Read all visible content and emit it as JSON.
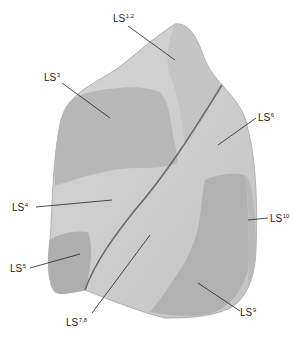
{
  "diagram": {
    "labels": [
      {
        "id": "ls12",
        "base": "LS",
        "sup": "1,2",
        "x": 113,
        "y": 13
      },
      {
        "id": "ls3",
        "base": "LS",
        "sup": "3",
        "x": 44,
        "y": 72
      },
      {
        "id": "ls6",
        "base": "LS",
        "sup": "6",
        "x": 258,
        "y": 112
      },
      {
        "id": "ls4",
        "base": "LS",
        "sup": "4",
        "x": 12,
        "y": 202
      },
      {
        "id": "ls10",
        "base": "LS",
        "sup": "10",
        "x": 270,
        "y": 213
      },
      {
        "id": "ls5",
        "base": "LS",
        "sup": "5",
        "x": 10,
        "y": 263
      },
      {
        "id": "ls78",
        "base": "LS",
        "sup": "7,8",
        "x": 66,
        "y": 317
      },
      {
        "id": "ls9",
        "base": "LS",
        "sup": "9",
        "x": 240,
        "y": 307
      }
    ],
    "colors": {
      "light": "#dcdcdc",
      "mid": "#bdbdbd",
      "dark": "#a4a4a4",
      "fissure": "#6a6a6a",
      "leader": "#222222"
    }
  }
}
